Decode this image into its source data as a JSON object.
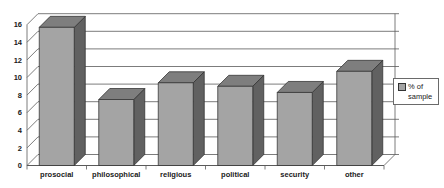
{
  "window": {
    "background": "#ffffff"
  },
  "chart_data": {
    "type": "bar",
    "style": "3d-column-grayscale",
    "title": "",
    "xlabel": "",
    "ylabel": "",
    "categories": [
      "prosocial",
      "philosophical",
      "religious",
      "political",
      "security",
      "other"
    ],
    "series": [
      {
        "name": "% of sample",
        "values": [
          15.7,
          7.5,
          9.4,
          9.0,
          8.3,
          10.7
        ]
      }
    ],
    "ylim": [
      0,
      16
    ],
    "ytick_step": 2,
    "yticks": [
      0,
      2,
      4,
      6,
      8,
      10,
      12,
      14,
      16
    ],
    "grid": true,
    "legend": {
      "label": "% of sample",
      "position": "right",
      "border": true
    },
    "colors": {
      "bar_front": "#a4a4a4",
      "bar_top": "#7e7e7e",
      "bar_side": "#616161",
      "bar_outline": "#2f2f2f",
      "gridline": "#5a5a5a",
      "axis_text": "#1a1a1a",
      "background": "#ffffff"
    }
  }
}
